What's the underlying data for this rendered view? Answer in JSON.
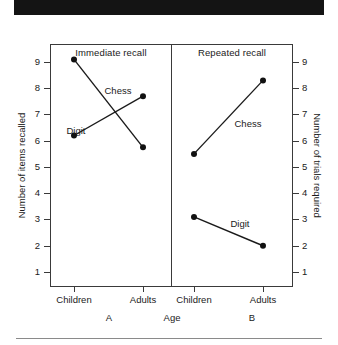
{
  "banner": {
    "label": ""
  },
  "chart_data": {
    "type": "line",
    "title": "",
    "xlabel": "Age",
    "grid": false,
    "legend_position": "inline-labels",
    "categories": [
      "Children",
      "Adults"
    ],
    "panels": [
      {
        "key": "A",
        "letter": "A",
        "title": "Immediate recall",
        "axis": "left",
        "ylabel": "Number of items recalled",
        "ylim": [
          0,
          9.6
        ],
        "yticks": [
          1,
          2,
          3,
          4,
          5,
          6,
          7,
          8,
          9
        ],
        "series": [
          {
            "name": "Chess",
            "values": [
              9.1,
              5.75
            ]
          },
          {
            "name": "Digit",
            "values": [
              6.2,
              7.7
            ]
          }
        ]
      },
      {
        "key": "B",
        "letter": "B",
        "title": "Repeated recall",
        "axis": "right",
        "ylabel": "Number of trials required",
        "ylim": [
          0,
          9.6
        ],
        "yticks": [
          1,
          2,
          3,
          4,
          5,
          6,
          7,
          8,
          9
        ],
        "series": [
          {
            "name": "Chess",
            "values": [
              5.5,
              8.3
            ]
          },
          {
            "name": "Digit",
            "values": [
              3.1,
              2.0
            ]
          }
        ]
      }
    ]
  },
  "axes": {
    "left": {
      "title": "Number of items recalled",
      "ticks": [
        "9",
        "8",
        "7",
        "6",
        "5",
        "4",
        "3",
        "2",
        "1"
      ]
    },
    "right": {
      "title": "Number of trials required",
      "ticks": [
        "9",
        "8",
        "7",
        "6",
        "5",
        "4",
        "3",
        "2",
        "1"
      ]
    },
    "x": {
      "title": "Age",
      "labels_a": [
        "Children",
        "Adults"
      ],
      "labels_b": [
        "Children",
        "Adults"
      ]
    }
  },
  "panel_titles": {
    "a": "Immediate recall",
    "b": "Repeated recall"
  },
  "panel_letters": {
    "a": "A",
    "b": "B"
  },
  "series_labels": {
    "a_chess": "Chess",
    "a_digit": "Digit",
    "b_chess": "Chess",
    "b_digit": "Digit"
  },
  "colors": {
    "ink": "#1a1a1a",
    "frame": "#3a3a3a",
    "banner": "#141414",
    "rule": "#8a8a8a"
  }
}
